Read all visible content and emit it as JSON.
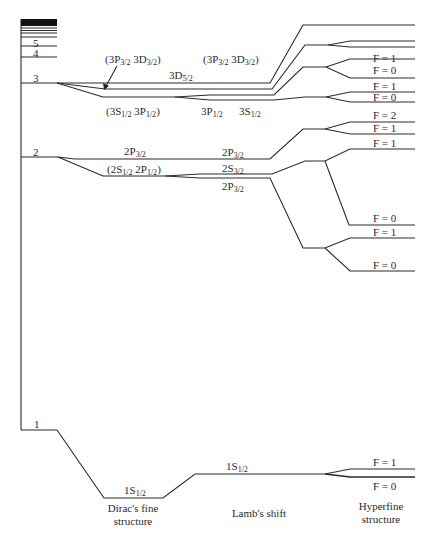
{
  "diagram": {
    "type": "hydrogen energy level diagram",
    "principal_levels": [
      {
        "n": "1",
        "label": "1"
      },
      {
        "n": "2",
        "label": "2"
      },
      {
        "n": "3",
        "label": "3"
      },
      {
        "n": "4",
        "label": "4"
      },
      {
        "n": "5",
        "label": "5"
      }
    ],
    "n3": {
      "upper_pair": {
        "main": "(3P",
        "sub1": "3/2",
        "mid": " 3D",
        "sub2": "3/2",
        "end": ")"
      },
      "d52": {
        "main": "3D",
        "sub": "5/2"
      },
      "upper_pair_right": {
        "main": "(3P",
        "sub1": "3/2",
        "mid": " 3D",
        "sub2": "3/2",
        "end": ")"
      },
      "lower_pair": {
        "main": "(3S",
        "sub1": "1/2",
        "mid": " 3P",
        "sub2": "1/2",
        "end": ")"
      },
      "p12": {
        "main": "3P",
        "sub": "1/2"
      },
      "s12": {
        "main": "3S",
        "sub": "1/2"
      }
    },
    "n2": {
      "p32_left": {
        "main": "2P",
        "sub": "3/2"
      },
      "pair": {
        "main": "(2S",
        "sub1": "1/2",
        "mid": " 2P",
        "sub2": "1/2",
        "end": ")"
      },
      "p32_right": {
        "main": "2P",
        "sub": "3/2"
      },
      "s_mid": {
        "main": "2S",
        "sub": "3/2"
      },
      "p_low": {
        "main": "2P",
        "sub": "3/2"
      }
    },
    "n1": {
      "fine": {
        "main": "1S",
        "sub": "1/2"
      },
      "lamb": {
        "main": "1S",
        "sub": "1/2"
      }
    },
    "hyperfine_labels": [
      {
        "text": "F = 1",
        "y": 52
      },
      {
        "text": "F = 0",
        "y": 71
      },
      {
        "text": "F = 1",
        "y": 85
      },
      {
        "text": "F = 0",
        "y": 96
      },
      {
        "text": "F = 2",
        "y": 115
      },
      {
        "text": "F = 1",
        "y": 127
      },
      {
        "text": "F = 1",
        "y": 142
      },
      {
        "text": "F = 0",
        "y": 218
      },
      {
        "text": "F = 1",
        "y": 231
      },
      {
        "text": "F = 0",
        "y": 264
      },
      {
        "text": "F = 1",
        "y": 461
      },
      {
        "text": "F = 0",
        "y": 481
      }
    ],
    "captions": {
      "fine": {
        "line1": "Dirac's fine",
        "line2": "structure"
      },
      "lamb": {
        "line1": "Lamb's shift"
      },
      "hyperfine": {
        "line1": "Hyperfine",
        "line2": "structure"
      }
    }
  }
}
